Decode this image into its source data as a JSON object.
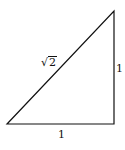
{
  "diagram": {
    "type": "right-triangle",
    "vertices": [
      [
        7,
        124
      ],
      [
        114,
        124
      ],
      [
        114,
        11
      ]
    ],
    "labels": {
      "hypotenuse_symbol": "√",
      "hypotenuse_radicand": "2",
      "vertical_side": "1",
      "horizontal_side": "1"
    },
    "stroke_color": "#111111",
    "background": "#ffffff"
  }
}
